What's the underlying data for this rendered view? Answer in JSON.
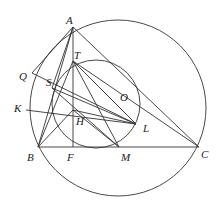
{
  "diagram": {
    "type": "geometry",
    "points": {
      "A": {
        "label": "A",
        "x": 73,
        "y": 27,
        "lx": 66,
        "ly": 24
      },
      "B": {
        "label": "B",
        "x": 38,
        "y": 147,
        "lx": 27,
        "ly": 161
      },
      "C": {
        "label": "C",
        "x": 199,
        "y": 147,
        "lx": 201,
        "ly": 158
      },
      "F": {
        "label": "F",
        "x": 73,
        "y": 147,
        "lx": 67,
        "ly": 161
      },
      "M": {
        "label": "M",
        "x": 119,
        "y": 147,
        "lx": 121,
        "ly": 161
      },
      "T": {
        "label": "T",
        "x": 73,
        "y": 61,
        "lx": 74,
        "ly": 59
      },
      "H": {
        "label": "H",
        "x": 73,
        "y": 110,
        "lx": 76,
        "ly": 125
      },
      "S": {
        "label": "S",
        "x": 52,
        "y": 88,
        "lx": 46,
        "ly": 86
      },
      "Q": {
        "label": "Q",
        "x": 32,
        "y": 73,
        "lx": 19,
        "ly": 80
      },
      "K": {
        "label": "K",
        "x": 26,
        "y": 110,
        "lx": 14,
        "ly": 112
      },
      "L": {
        "label": "L",
        "x": 136,
        "y": 124,
        "lx": 143,
        "ly": 132
      },
      "O": {
        "label": "O",
        "x": 120,
        "y": 97,
        "lx": 120,
        "ly": 101
      }
    },
    "circles": [
      {
        "name": "circumcircle",
        "cx": 118,
        "cy": 108,
        "r": 88
      },
      {
        "name": "inner-circle",
        "cx": 96,
        "cy": 104,
        "r": 44
      }
    ],
    "segments": [
      [
        "A",
        "B"
      ],
      [
        "A",
        "C"
      ],
      [
        "B",
        "C"
      ],
      [
        "A",
        "F"
      ],
      [
        "A",
        "Q"
      ],
      [
        "A",
        "S"
      ],
      [
        "Q",
        "L"
      ],
      [
        "K",
        "L"
      ],
      [
        "T",
        "M"
      ],
      [
        "T",
        "L"
      ],
      [
        "S",
        "M"
      ],
      [
        "B",
        "T"
      ],
      [
        "H",
        "L"
      ],
      [
        "B",
        "H"
      ],
      [
        "H",
        "M"
      ],
      [
        "S",
        "L"
      ],
      [
        "T",
        "C"
      ]
    ]
  }
}
